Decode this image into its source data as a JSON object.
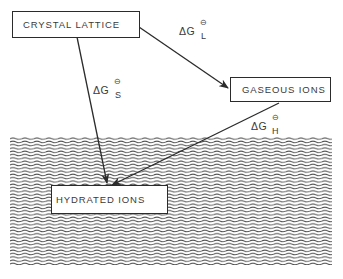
{
  "diagram": {
    "type": "thermodynamic-cycle",
    "nodes": {
      "crystal_lattice": {
        "label": "CRYSTAL LATTICE"
      },
      "gaseous_ions": {
        "label": "GASEOUS IONS"
      },
      "hydrated_ions": {
        "label": "HYDRATED IONS"
      }
    },
    "edges": {
      "lattice": {
        "from": "CRYSTAL LATTICE",
        "to": "GASEOUS IONS",
        "symbol": "ΔG",
        "subscript": "L",
        "superscript": "⊖"
      },
      "solution": {
        "from": "CRYSTAL LATTICE",
        "to": "HYDRATED IONS",
        "symbol": "ΔG",
        "subscript": "S",
        "superscript": "⊖"
      },
      "hydration": {
        "from": "GASEOUS IONS",
        "to": "HYDRATED IONS",
        "symbol": "ΔG",
        "subscript": "H",
        "superscript": "⊖"
      }
    },
    "water_region": {
      "pattern": "wavy-lines",
      "color": "#4a4a4a"
    },
    "colors": {
      "line": "#2b2b2b",
      "text": "#3a3a3a",
      "background": "#ffffff"
    }
  }
}
